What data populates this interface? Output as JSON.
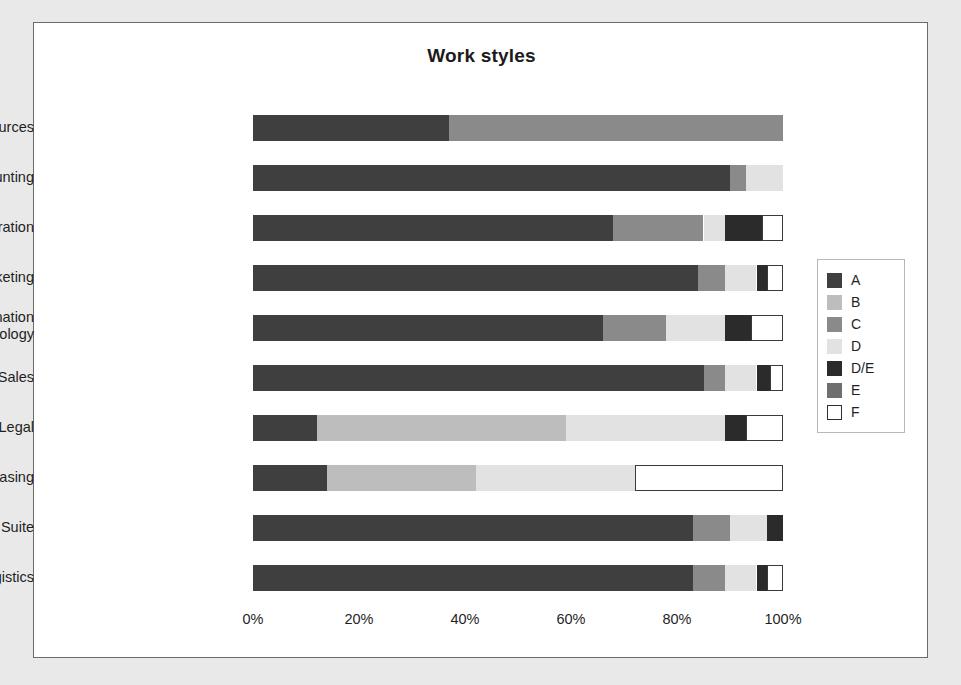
{
  "figure": {
    "title": "Work styles",
    "background": "#ffffff",
    "page_background": "#e9e9e9",
    "border_color": "#6b6b6b"
  },
  "legend": {
    "position": "right",
    "items": [
      {
        "label": "A",
        "color": "#3f3f3f",
        "outlined": false
      },
      {
        "label": "B",
        "color": "#bdbdbd",
        "outlined": false
      },
      {
        "label": "C",
        "color": "#8a8a8a",
        "outlined": false
      },
      {
        "label": "D",
        "color": "#e2e2e2",
        "outlined": false
      },
      {
        "label": "D/E",
        "color": "#2b2b2b",
        "outlined": false
      },
      {
        "label": "E",
        "color": "#6f6f6f",
        "outlined": false
      },
      {
        "label": "F",
        "color": "#ffffff",
        "outlined": true
      }
    ]
  },
  "xaxis": {
    "ticks": [
      "0%",
      "20%",
      "40%",
      "60%",
      "80%",
      "100%"
    ],
    "tick_values": [
      0,
      20,
      40,
      60,
      80,
      100
    ],
    "range": [
      0,
      100
    ]
  },
  "chart_data": {
    "type": "bar",
    "orientation": "horizontal",
    "stacked": true,
    "normalized": true,
    "title": "Work styles",
    "xlabel": "",
    "ylabel": "",
    "xlim": [
      0,
      100
    ],
    "grid": false,
    "legend_position": "right",
    "tick_labels": [
      "0%",
      "20%",
      "40%",
      "60%",
      "80%",
      "100%"
    ],
    "categories": [
      "Human Resources",
      "Accounting",
      "Administration",
      "Marketing",
      "Information Technology",
      "Sales",
      "Legal",
      "Purchasing",
      "Corporate Suite",
      "Logistics"
    ],
    "series": [
      {
        "name": "A",
        "color": "#3f3f3f",
        "values": [
          37,
          90,
          68,
          84,
          66,
          85,
          12,
          14,
          83,
          83
        ]
      },
      {
        "name": "B",
        "color": "#bdbdbd",
        "values": [
          0,
          0,
          0,
          0,
          0,
          0,
          47,
          28,
          0,
          0
        ]
      },
      {
        "name": "C",
        "color": "#8a8a8a",
        "values": [
          63,
          3,
          17,
          5,
          12,
          4,
          0,
          0,
          7,
          6
        ]
      },
      {
        "name": "D",
        "color": "#e2e2e2",
        "values": [
          0,
          7,
          4,
          6,
          11,
          6,
          30,
          30,
          7,
          6
        ]
      },
      {
        "name": "D/E",
        "color": "#2b2b2b",
        "values": [
          0,
          0,
          7,
          2,
          5,
          2.5,
          4,
          0,
          3,
          2
        ]
      },
      {
        "name": "E",
        "color": "#6f6f6f",
        "values": [
          0,
          0,
          0,
          0,
          0,
          0,
          0,
          0,
          0,
          0
        ]
      },
      {
        "name": "F",
        "color": "#ffffff",
        "values": [
          0,
          0,
          4,
          3,
          6,
          2.5,
          7,
          28,
          0,
          3
        ]
      }
    ]
  }
}
